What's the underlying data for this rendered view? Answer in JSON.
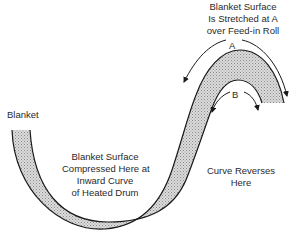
{
  "diagram": {
    "labels": {
      "blanket": "Blanket",
      "stretched": [
        "Blanket Surface",
        "Is Stretched at A",
        "over Feed-in Roll"
      ],
      "compressed": [
        "Blanket Surface",
        "Compressed Here at",
        "Inward Curve",
        "of Heated Drum"
      ],
      "reverses": [
        "Curve Reverses",
        "Here"
      ],
      "point_a": "A",
      "point_b": "B"
    },
    "colors": {
      "band_fill": "#c8c8c8",
      "outline": "#1a1a1a",
      "background": "#ffffff"
    }
  }
}
